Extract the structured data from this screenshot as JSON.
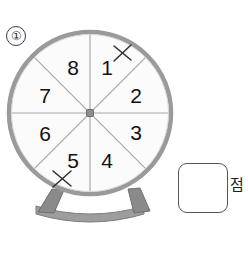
{
  "problem": {
    "number_label": "①"
  },
  "spinner": {
    "name": "eight-sector-spinner",
    "center": {
      "x": 90,
      "y": 113
    },
    "radius": 82,
    "rim_color": "#9a9a9a",
    "face_color": "#fbfbfb",
    "divider_color": "#a8a8a8",
    "hub_color": "#8d8d8d",
    "sector_count": 8,
    "sectors": [
      {
        "label": "1",
        "x": 107,
        "y": 69,
        "marked": true
      },
      {
        "label": "2",
        "x": 136,
        "y": 97,
        "marked": false
      },
      {
        "label": "3",
        "x": 136,
        "y": 134,
        "marked": false
      },
      {
        "label": "4",
        "x": 107,
        "y": 162,
        "marked": false
      },
      {
        "label": "5",
        "x": 73,
        "y": 162,
        "marked": true
      },
      {
        "label": "6",
        "x": 45,
        "y": 135,
        "marked": false
      },
      {
        "label": "7",
        "x": 45,
        "y": 97,
        "marked": false
      },
      {
        "label": "8",
        "x": 73,
        "y": 69,
        "marked": false
      }
    ],
    "marks": [
      {
        "name": "x-mark-on-1",
        "x": 123,
        "y": 53,
        "size": 9
      },
      {
        "name": "x-mark-on-5",
        "x": 62,
        "y": 179,
        "size": 9
      }
    ],
    "stand": {
      "leg_color": "#8a8a8a",
      "base_color": "#9d9d9d",
      "left_leg_x": 44,
      "right_leg_x": 136,
      "base_y": 212
    }
  },
  "answer": {
    "box_value": "",
    "unit_label": "점"
  }
}
